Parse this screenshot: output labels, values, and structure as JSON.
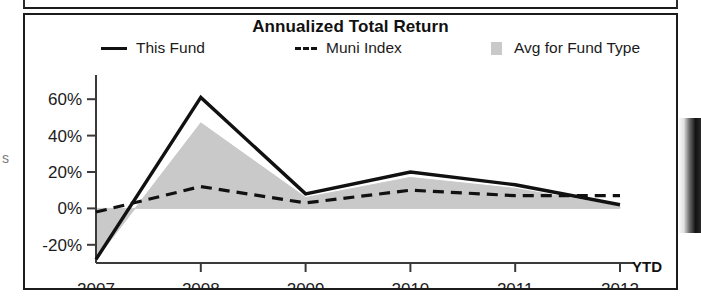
{
  "chart_data": {
    "type": "line",
    "title": "Annualized Total Return",
    "xlabel": "",
    "ylabel": "",
    "x": [
      "2007",
      "2008",
      "2009",
      "2010",
      "2011",
      "2012"
    ],
    "xtick_labels": [
      "2007",
      "2008",
      "2009",
      "2010",
      "2011",
      "2012"
    ],
    "x_axis_suffix": "YTD",
    "ytick_labels": [
      "60%",
      "40%",
      "20%",
      "0%",
      "-20%"
    ],
    "ytick_values": [
      60,
      40,
      20,
      0,
      -20
    ],
    "ylim": [
      -30,
      70
    ],
    "grid": false,
    "legend_position": "top",
    "series": [
      {
        "name": "This Fund",
        "style": "solid",
        "color": "#111111",
        "values": [
          -28,
          61,
          8,
          20,
          13,
          2
        ]
      },
      {
        "name": "Muni Index",
        "style": "dashed",
        "color": "#111111",
        "values": [
          -2,
          12,
          3,
          10,
          7,
          7
        ]
      },
      {
        "name": "Avg for Fund Type",
        "style": "area",
        "color": "#c9c9c9",
        "values": [
          -28,
          47,
          6,
          17,
          11,
          1
        ]
      }
    ]
  },
  "chart": {
    "title": "Annualized Total Return",
    "legend": [
      {
        "label": "This Fund",
        "marker": "solid-line-swatch"
      },
      {
        "label": "Muni Index",
        "marker": "dashed-line-swatch"
      },
      {
        "label": "Avg for Fund Type",
        "marker": "gray-area-swatch"
      }
    ],
    "y_ticks": [
      "60%",
      "40%",
      "20%",
      "0%",
      "-20%"
    ],
    "x_ticks": [
      "2007",
      "2008",
      "2009",
      "2010",
      "2011",
      "2012"
    ],
    "ytd_label": "YTD"
  }
}
